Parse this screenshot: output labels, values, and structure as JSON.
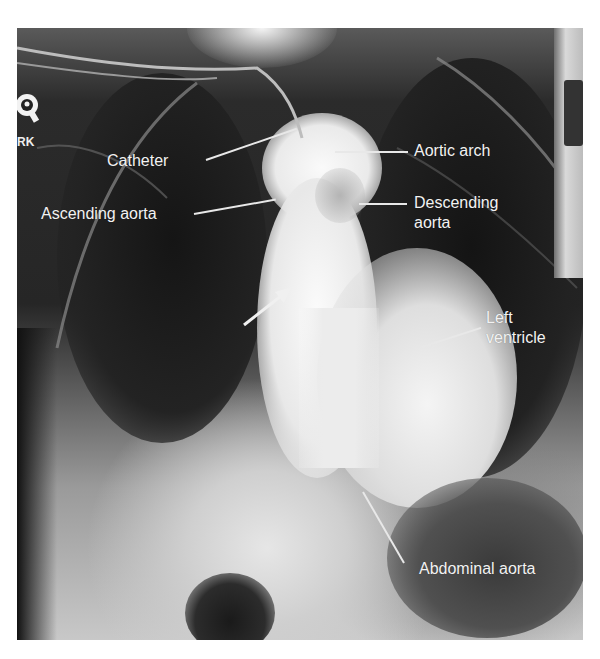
{
  "figure": {
    "type": "radiograph",
    "marker_text": "RK",
    "side_strip_text": "H026",
    "labels": [
      {
        "id": "catheter",
        "text": "Catheter"
      },
      {
        "id": "aortic_arch",
        "text": "Aortic arch"
      },
      {
        "id": "ascending_aorta",
        "text": "Ascending aorta"
      },
      {
        "id": "descending_aorta",
        "text": "Descending\naorta"
      },
      {
        "id": "left_ventricle",
        "text": "Left\nventricle"
      },
      {
        "id": "abdominal_aorta",
        "text": "Abdominal aorta"
      }
    ],
    "arrow": {
      "direction": "up-right",
      "color": "#f0f0f0"
    },
    "colors": {
      "background": "#ffffff",
      "lung_dark": "#1e1e1e",
      "soft_tissue": "#8a8a8a",
      "contrast_bright": "#f4f4f4",
      "label_text": "#f2f2f2"
    }
  }
}
